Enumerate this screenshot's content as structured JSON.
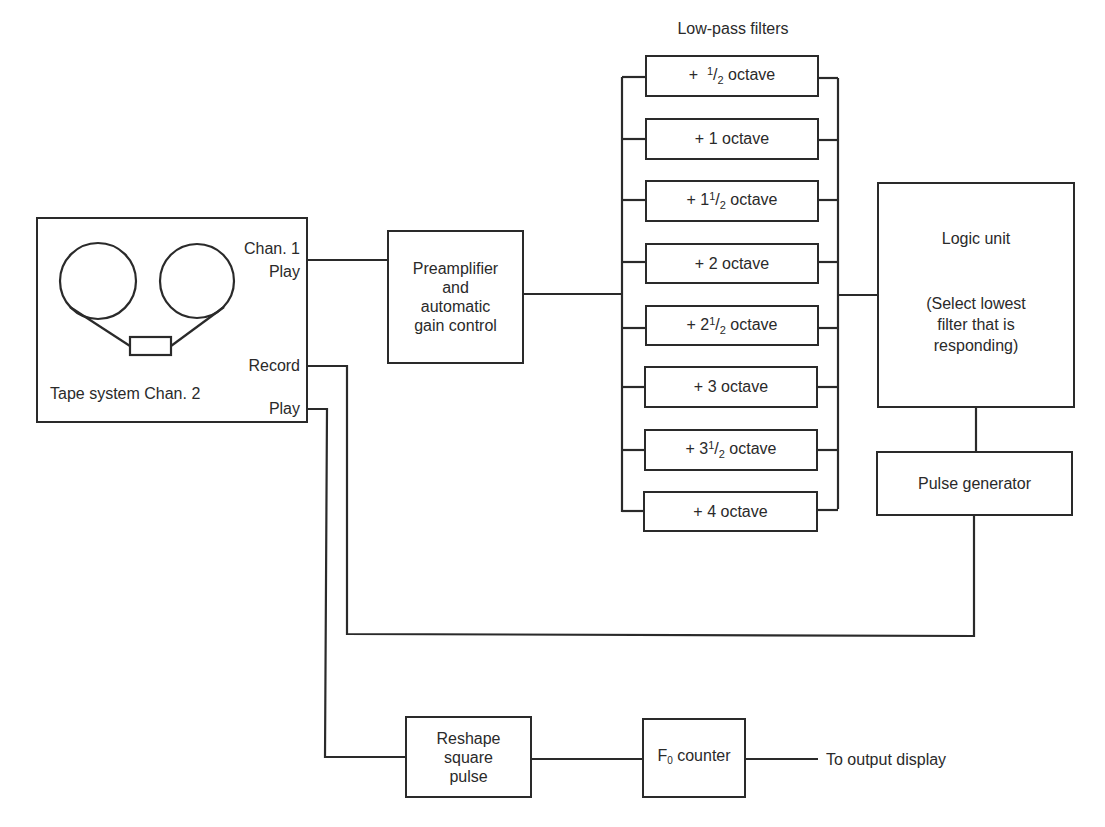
{
  "title": "Low-pass filters",
  "tape_system": {
    "label": "Tape system Chan. 2",
    "ports": {
      "chan1_line1": "Chan. 1",
      "chan1_line2": "Play",
      "record": "Record",
      "play": "Play"
    }
  },
  "preamp": {
    "lines": [
      "Preamplifier",
      "and",
      "automatic",
      "gain control"
    ]
  },
  "filters": [
    {
      "prefix": "+ ",
      "whole": "",
      "frac": true,
      "suffix": " octave"
    },
    {
      "prefix": "+ ",
      "whole": "1",
      "frac": false,
      "suffix": " octave"
    },
    {
      "prefix": "+ ",
      "whole": "1",
      "frac": true,
      "suffix": " octave"
    },
    {
      "prefix": "+ ",
      "whole": "2",
      "frac": false,
      "suffix": " octave"
    },
    {
      "prefix": "+ ",
      "whole": "2",
      "frac": true,
      "suffix": " octave"
    },
    {
      "prefix": "+ ",
      "whole": "3",
      "frac": false,
      "suffix": " octave"
    },
    {
      "prefix": "+ ",
      "whole": "3",
      "frac": true,
      "suffix": " octave"
    },
    {
      "prefix": "+ ",
      "whole": "4",
      "frac": false,
      "suffix": " octave"
    }
  ],
  "filter_texts": [
    "+ ½ octave",
    "+ 1 octave",
    "+ 1½ octave",
    "+ 2 octave",
    "+ 2½ octave",
    "+ 3 octave",
    "+ 3½ octave",
    "+ 4 octave"
  ],
  "logic_unit": {
    "title": "Logic unit",
    "desc_lines": [
      "(Select lowest",
      "filter that is",
      "responding)"
    ]
  },
  "pulse_generator": {
    "label": "Pulse generator"
  },
  "reshape": {
    "lines": [
      "Reshape",
      "square",
      "pulse"
    ]
  },
  "f0_counter": {
    "main": "F",
    "sub": "0",
    "rest": " counter"
  },
  "output": {
    "label": "To output display"
  },
  "frac": {
    "num": "1",
    "den": "2"
  }
}
